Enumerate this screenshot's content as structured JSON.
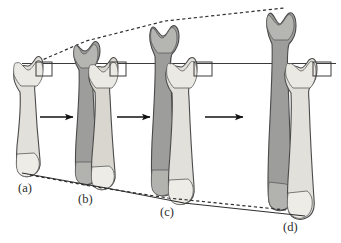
{
  "figure": {
    "kind": "bone-growth-stage-diagram",
    "background_color": "#ffffff"
  },
  "colors": {
    "light_bone_fill": "#e2e0da",
    "light_bone_fill_2": "#d8d6cf",
    "light_bone_epiphysis": "#ebe9e3",
    "dark_bone_fill": "#9d9d9b",
    "dark_bone_fill_2": "#8e8e8c",
    "dark_bone_epiphysis": "#b5b5b2",
    "outline": "#4a4a4a",
    "guide_line": "#3a3a3a",
    "arrow": "#111111",
    "marker_box": "#3a3a3a",
    "label_text": "#2b2b2b"
  },
  "stages": [
    {
      "id": "a",
      "label": "(a)",
      "label_x": 18,
      "label_y": 190,
      "has_reference_bone": true,
      "has_grown_bone": false,
      "reference_bone": {
        "top_y": 62,
        "bottom_y": 172,
        "center_x": 27
      },
      "marker_box": {
        "x": 36,
        "y": 62,
        "w": 16,
        "h": 14
      }
    },
    {
      "id": "b",
      "label": "(b)",
      "label_x": 78,
      "label_y": 200,
      "has_reference_bone": true,
      "has_grown_bone": true,
      "grown_bone": {
        "top_y": 42,
        "bottom_y": 183,
        "center_x": 86
      },
      "reference_bone": {
        "top_y": 63,
        "bottom_y": 184,
        "center_x": 101
      },
      "marker_box": {
        "x": 110,
        "y": 62,
        "w": 16,
        "h": 14
      }
    },
    {
      "id": "c",
      "label": "(c)",
      "label_x": 160,
      "label_y": 213,
      "has_reference_bone": true,
      "has_grown_bone": true,
      "grown_bone": {
        "top_y": 22,
        "bottom_y": 196,
        "center_x": 165
      },
      "reference_bone": {
        "top_y": 63,
        "bottom_y": 199,
        "center_x": 180
      },
      "marker_box": {
        "x": 194,
        "y": 62,
        "w": 18,
        "h": 14
      }
    },
    {
      "id": "d",
      "label": "(d)",
      "label_x": 282,
      "label_y": 227,
      "has_reference_bone": true,
      "has_grown_bone": true,
      "grown_bone": {
        "top_y": 8,
        "bottom_y": 208,
        "center_x": 283
      },
      "reference_bone": {
        "top_y": 63,
        "bottom_y": 212,
        "center_x": 300
      },
      "marker_box": {
        "x": 313,
        "y": 62,
        "w": 18,
        "h": 14
      }
    }
  ],
  "arrows": [
    {
      "name": "arrow-a-to-b",
      "x1": 40,
      "y1": 117,
      "x2": 74,
      "y2": 117
    },
    {
      "name": "arrow-b-to-c",
      "x1": 115,
      "y1": 117,
      "x2": 150,
      "y2": 117
    },
    {
      "name": "arrow-c-to-d",
      "x1": 200,
      "y1": 117,
      "x2": 240,
      "y2": 117
    }
  ],
  "guides": {
    "top_solid_line": {
      "name": "reference-top-level-line",
      "x1": 22,
      "y1": 63,
      "x2": 335,
      "y2": 63,
      "style": "solid"
    },
    "top_dashed_line": {
      "name": "growth-divergence-line-top",
      "points": "33,63 86,42 165,22 283,9",
      "style": "dashed"
    },
    "bottom_solid_line": {
      "name": "reference-bottom-level-line",
      "points": "22,172 101,186 180,200 300,213",
      "style": "solid"
    },
    "bottom_dashed_line": {
      "name": "growth-divergence-line-bottom",
      "points": "30,174 86,184 165,197 283,209",
      "style": "dashed"
    }
  }
}
